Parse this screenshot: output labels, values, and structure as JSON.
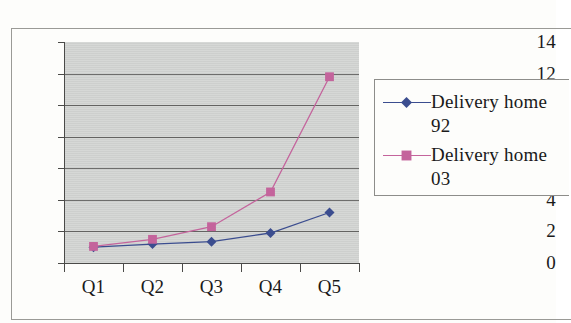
{
  "chart_data": {
    "type": "line",
    "title": "",
    "subtitle": "",
    "xlabel": "",
    "ylabel": "",
    "categories": [
      "Q1",
      "Q2",
      "Q3",
      "Q4",
      "Q5"
    ],
    "series": [
      {
        "name": "Delivery home 92",
        "legend_line1": "Delivery home",
        "legend_line2": "92",
        "color": "#3b4d8f",
        "marker": "diamond",
        "values": [
          1.0,
          1.2,
          1.35,
          1.9,
          3.2
        ]
      },
      {
        "name": "Delivery home 03",
        "legend_line1": "Delivery home",
        "legend_line2": "03",
        "color": "#c4649c",
        "marker": "square",
        "values": [
          1.05,
          1.5,
          2.3,
          4.5,
          11.8
        ]
      }
    ],
    "y_ticks": [
      0,
      2,
      4,
      6,
      8,
      10,
      12,
      14
    ],
    "ylim": [
      0,
      14
    ],
    "grid": true,
    "grid_axis": "y",
    "legend_position": "right",
    "plot_background": "#d4d6d4"
  },
  "axis": {
    "y_tick_labels": [
      "14",
      "12",
      "10",
      "8",
      "6",
      "4",
      "2",
      "0"
    ],
    "x_tick_labels": [
      "Q1",
      "Q2",
      "Q3",
      "Q4",
      "Q5"
    ]
  },
  "legend": {
    "entries": [
      {
        "line1": "Delivery home",
        "line2": "92"
      },
      {
        "line1": "Delivery home",
        "line2": "03"
      }
    ]
  }
}
